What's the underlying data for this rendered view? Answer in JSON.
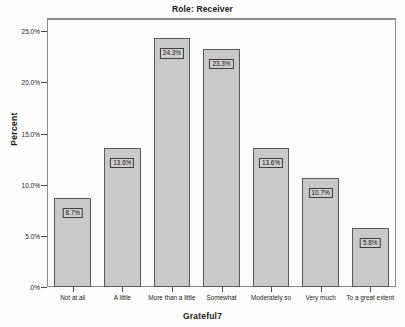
{
  "chart_data": {
    "type": "bar",
    "title": "Role: Receiver",
    "xlabel": "Grateful7",
    "ylabel": "Percent",
    "categories": [
      "Not at all",
      "A little",
      "More than a little",
      "Somewhat",
      "Moderately so",
      "Very much",
      "To a great extent"
    ],
    "values": [
      8.7,
      13.6,
      24.3,
      23.3,
      13.6,
      10.7,
      5.8
    ],
    "data_labels": [
      "8.7%",
      "13.6%",
      "24.3%",
      "23.3%",
      "13.6%",
      "10.7%",
      "5.8%"
    ],
    "ylim": [
      0,
      26.2
    ],
    "yticks": [
      0,
      5,
      10,
      15,
      20,
      25
    ],
    "ytick_labels": [
      ".0%",
      "5.0%",
      "10.0%",
      "15.0%",
      "20.0%",
      "25.0%"
    ],
    "grid": false,
    "legend": null,
    "colors": {
      "bar_fill": "#c9c9c9",
      "bar_border": "#5a5a5a",
      "label_fill": "#cfcfcf",
      "label_border": "#3d3d3d",
      "axis": "#8a8a8a",
      "text": "#1a1a1a",
      "plot_background": "#fbfbfb"
    }
  }
}
